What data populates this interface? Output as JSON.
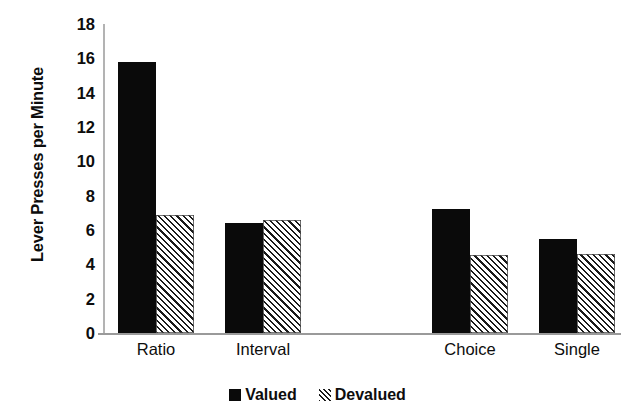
{
  "chart_data": {
    "type": "bar",
    "title": "",
    "xlabel": "",
    "ylabel": "Lever Presses per Minute",
    "categories": [
      "Ratio",
      "Interval",
      "Choice",
      "Single"
    ],
    "series": [
      {
        "name": "Valued",
        "values": [
          15.8,
          6.4,
          7.2,
          5.5
        ],
        "color": "#0a0a0a",
        "pattern": "solid"
      },
      {
        "name": "Devalued",
        "values": [
          6.9,
          6.6,
          4.55,
          4.6
        ],
        "color": "#1a1a1a",
        "pattern": "diagonal-hatch"
      }
    ],
    "ylim": [
      0,
      18
    ],
    "yticks": [
      0,
      2,
      4,
      6,
      8,
      10,
      12,
      14,
      16,
      18
    ],
    "ytick_labels": [
      "0",
      "2",
      "4",
      "6",
      "8",
      "10",
      "12",
      "14",
      "16",
      "18"
    ],
    "grid": false,
    "legend_position": "bottom-center",
    "legend_entries": [
      "Valued",
      "Devalued"
    ],
    "group_gap_after_index": 1
  },
  "axis": {
    "y_title": "Lever Presses per Minute"
  },
  "legend": {
    "entries": [
      {
        "label": "Valued"
      },
      {
        "label": "Devalued"
      }
    ]
  },
  "icons": {
    "valued_swatch": "filled-square-icon",
    "devalued_swatch": "hatched-square-icon"
  }
}
